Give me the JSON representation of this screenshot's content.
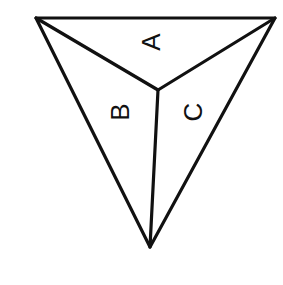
{
  "diagram": {
    "type": "triangular-pyramid-net",
    "vertices": {
      "top_left": [
        36,
        18
      ],
      "top_right": [
        275,
        18
      ],
      "bottom": [
        150,
        247
      ],
      "center": [
        158,
        90
      ]
    },
    "faces": [
      {
        "label": "A",
        "position": [
          151,
          42
        ],
        "rotation": -90
      },
      {
        "label": "B",
        "position": [
          120,
          112
        ],
        "rotation": -90
      },
      {
        "label": "C",
        "position": [
          193,
          112
        ],
        "rotation": -90
      }
    ],
    "colors": {
      "line": "#111111",
      "background": "#ffffff"
    }
  }
}
